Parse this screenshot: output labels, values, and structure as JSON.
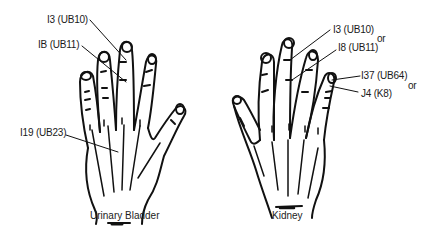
{
  "figure": {
    "background": "#ffffff",
    "ink_color": "#111111"
  },
  "left_hand": {
    "caption": "Urinary Bladder",
    "labels": [
      {
        "id": "i3",
        "text": "I3 (UB10)"
      },
      {
        "id": "ib",
        "text": "IB (UB11)"
      },
      {
        "id": "i19",
        "text": "I19 (UB23)"
      }
    ]
  },
  "right_hand": {
    "caption": "Kidney",
    "labels": [
      {
        "id": "i3",
        "text": "I3 (UB10)"
      },
      {
        "id": "i8",
        "text": "I8 (UB11)"
      },
      {
        "id": "i37",
        "text": "I37 (UB64)"
      },
      {
        "id": "j4",
        "text": "J4 (K8)"
      }
    ],
    "connectors": [
      "or",
      "or"
    ]
  }
}
